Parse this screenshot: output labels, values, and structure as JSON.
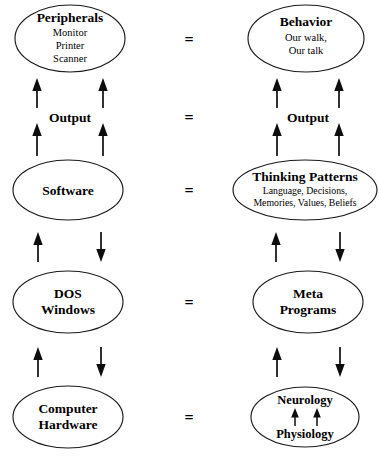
{
  "diagram": {
    "type": "two-column-analogy",
    "colors": {
      "background": "#ffffff",
      "stroke": "#1a1a1a",
      "arrow": "#0d0d0d",
      "text": "#000000"
    },
    "equals_symbol": "=",
    "columns": [
      {
        "id": "computer",
        "name": "Computer"
      },
      {
        "id": "mind",
        "name": "Mind"
      }
    ],
    "rows": [
      {
        "id": "row-peripherals-behavior",
        "left": {
          "title": "Peripherals",
          "sub": [
            "Monitor",
            "Printer",
            "Scanner"
          ]
        },
        "right": {
          "title": "Behavior",
          "sub": [
            "Our walk,",
            "Our talk"
          ]
        },
        "equals": "="
      },
      {
        "id": "row-output",
        "left": {
          "title": "Output",
          "sub": []
        },
        "right": {
          "title": "Output",
          "sub": []
        },
        "equals": "="
      },
      {
        "id": "row-software-thinking",
        "left": {
          "title": "Software",
          "sub": []
        },
        "right": {
          "title": "Thinking Patterns",
          "sub": [
            "Language, Decisions,",
            "Memories, Values, Beliefs"
          ]
        },
        "equals": "="
      },
      {
        "id": "row-dos-meta",
        "left": {
          "title": "DOS",
          "title2": "Windows",
          "sub": []
        },
        "right": {
          "title": "Meta",
          "title2": "Programs",
          "sub": []
        },
        "equals": "="
      },
      {
        "id": "row-hardware-neurology",
        "left": {
          "title": "Computer",
          "title2": "Hardware",
          "sub": []
        },
        "right": {
          "title": "Neurology",
          "title2": "Physiology",
          "sub": []
        },
        "equals": "="
      }
    ],
    "labels": {
      "peripherals": "Peripherals",
      "peripherals_l1": "Monitor",
      "peripherals_l2": "Printer",
      "peripherals_l3": "Scanner",
      "behavior": "Behavior",
      "behavior_l1": "Our walk,",
      "behavior_l2": "Our talk",
      "output_left": "Output",
      "output_right": "Output",
      "software": "Software",
      "thinking_patterns": "Thinking Patterns",
      "thinking_l1": "Language, Decisions,",
      "thinking_l2": "Memories, Values, Beliefs",
      "dos": "DOS",
      "windows": "Windows",
      "meta": "Meta",
      "programs": "Programs",
      "computer": "Computer",
      "hardware": "Hardware",
      "neurology": "Neurology",
      "physiology": "Physiology",
      "eq1": "=",
      "eq2": "=",
      "eq3": "=",
      "eq4": "=",
      "eq5": "="
    }
  }
}
